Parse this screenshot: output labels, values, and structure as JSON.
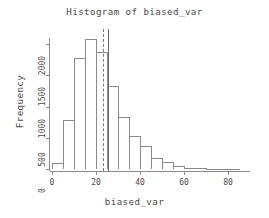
{
  "chart_data": {
    "type": "bar",
    "title": "Histogram of biased_var",
    "xlabel": "biased_var",
    "ylabel": "Frequency",
    "grid": false,
    "legend": null,
    "xlim": [
      0,
      90
    ],
    "ylim": [
      0,
      2100
    ],
    "bin_width": 5,
    "xticks": [
      0,
      20,
      40,
      60,
      80
    ],
    "xticklabels": [
      "0",
      "20",
      "40",
      "60",
      "80"
    ],
    "yticks": [
      0,
      500,
      1000,
      1500,
      2000
    ],
    "yticklabels": [
      "0",
      "500",
      "1000",
      "1500",
      "2000"
    ],
    "categories": [
      "0-5",
      "5-10",
      "10-15",
      "15-20",
      "20-25",
      "25-30",
      "30-35",
      "35-40",
      "40-45",
      "45-50",
      "50-55",
      "55-60",
      "60-65",
      "65-70",
      "70-75",
      "75-80",
      "80-85"
    ],
    "bin_edges": [
      0,
      5,
      10,
      15,
      20,
      25,
      30,
      35,
      40,
      45,
      50,
      55,
      60,
      65,
      70,
      75,
      80,
      85
    ],
    "values": [
      90,
      790,
      1780,
      2080,
      1880,
      1330,
      840,
      530,
      365,
      180,
      120,
      45,
      20,
      10,
      5,
      3,
      2
    ],
    "annotations": [
      {
        "name": "mean-line",
        "type": "vline",
        "style": "solid",
        "x": 25.5
      },
      {
        "name": "median-line",
        "type": "vline",
        "style": "dashed",
        "x": 23.0
      }
    ]
  },
  "colors": {
    "bar_border": "#8a8a8a",
    "bar_fill": "#ffffff",
    "axis": "#8c8c8c",
    "text": "#4a4a4a",
    "vline_solid": "#6b6b6b",
    "vline_dashed": "#7a7a7a",
    "background": "#ffffff"
  }
}
